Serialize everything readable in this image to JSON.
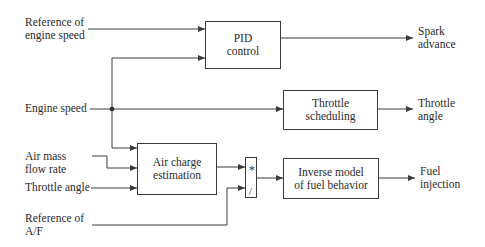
{
  "inputs": {
    "ref_engine_speed": "Reference of\nengine speed",
    "engine_speed": "Engine speed",
    "air_mass_flow": "Air mass\nflow rate",
    "throttle_angle": "Throttle angle",
    "ref_af": "Reference of\nA/F"
  },
  "blocks": {
    "pid": "PID\ncontrol",
    "throttle_sched": "Throttle\nscheduling",
    "air_charge": "Air charge\nestimation",
    "divider_mul": "*",
    "divider_div": "/",
    "inverse_model": "Inverse model\nof fuel behavior"
  },
  "outputs": {
    "spark_advance": "Spark\nadvance",
    "throttle_angle": "Throttle\nangle",
    "fuel_injection": "Fuel\ninjection"
  },
  "colors": {
    "line": "#3a3a3a",
    "text": "#2a2a2a"
  }
}
